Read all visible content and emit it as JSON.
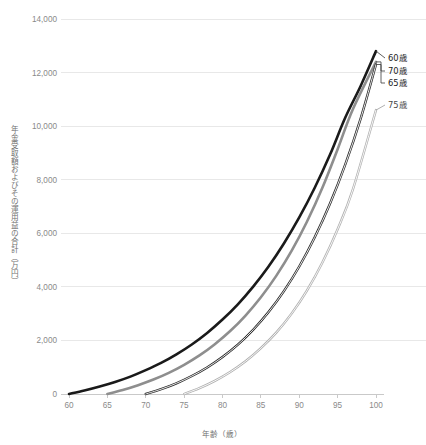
{
  "chart_data": {
    "type": "line",
    "title": "",
    "xlabel": "年齢（歳）",
    "ylabel": "年金受取額およびその運用益の合計（万円）",
    "xlim": [
      60,
      100
    ],
    "ylim": [
      0,
      14000
    ],
    "xticks": [
      60,
      65,
      70,
      75,
      80,
      85,
      90,
      95,
      100
    ],
    "xtick_labels": [
      "60",
      "65",
      "70",
      "75",
      "80",
      "85",
      "90",
      "95",
      "100"
    ],
    "yticks": [
      0,
      2000,
      4000,
      6000,
      8000,
      10000,
      12000,
      14000
    ],
    "ytick_labels": [
      "0",
      "2,000",
      "4,000",
      "6,000",
      "8,000",
      "10,000",
      "12,000",
      "14,000"
    ],
    "grid": true,
    "legend_position": "right-inline-labels",
    "series": [
      {
        "name": "60歳",
        "label": "60歳",
        "color": "#1a1a1a",
        "style": "solid",
        "stroke_width": 2.6,
        "x": [
          60,
          62,
          64,
          66,
          68,
          70,
          72,
          74,
          76,
          78,
          80,
          82,
          84,
          86,
          88,
          90,
          92,
          94,
          96,
          98,
          100
        ],
        "values": [
          0,
          130,
          280,
          450,
          650,
          890,
          1160,
          1480,
          1850,
          2280,
          2780,
          3350,
          4010,
          4760,
          5620,
          6590,
          7690,
          8930,
          10320,
          11500,
          12800
        ]
      },
      {
        "name": "65歳",
        "label": "65歳",
        "color": "#8e8e8e",
        "style": "solid",
        "stroke_width": 2.6,
        "x": [
          65,
          67,
          69,
          71,
          73,
          75,
          77,
          79,
          81,
          83,
          85,
          87,
          89,
          91,
          93,
          95,
          97,
          100
        ],
        "values": [
          0,
          150,
          330,
          540,
          790,
          1090,
          1440,
          1860,
          2350,
          2930,
          3610,
          4410,
          5340,
          6430,
          7690,
          9140,
          10640,
          12400
        ]
      },
      {
        "name": "70歳",
        "label": "70歳",
        "color": "#2a2a2a",
        "style": "outline",
        "stroke_width": 2.4,
        "x": [
          70,
          72,
          74,
          76,
          78,
          80,
          82,
          84,
          86,
          88,
          90,
          92,
          94,
          96,
          98,
          100
        ],
        "values": [
          0,
          180,
          400,
          670,
          990,
          1380,
          1840,
          2400,
          3060,
          3840,
          4760,
          5840,
          7100,
          8570,
          10280,
          12300
        ]
      },
      {
        "name": "75歳",
        "label": "75歳",
        "color": "#b0b0b0",
        "style": "outline",
        "stroke_width": 2.4,
        "x": [
          75,
          77,
          79,
          81,
          83,
          85,
          87,
          89,
          91,
          93,
          95,
          97,
          100
        ],
        "values": [
          0,
          220,
          490,
          820,
          1220,
          1710,
          2290,
          3000,
          3860,
          4900,
          6150,
          7650,
          10600
        ]
      }
    ],
    "annotations": [
      {
        "label": "60歳",
        "series": "60歳"
      },
      {
        "label": "70歳",
        "series": "70歳"
      },
      {
        "label": "65歳",
        "series": "65歳"
      },
      {
        "label": "75歳",
        "series": "75歳"
      }
    ]
  }
}
